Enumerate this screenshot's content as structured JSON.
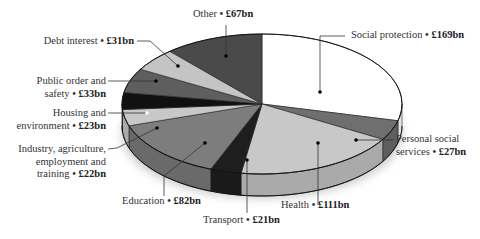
{
  "chart_data": {
    "type": "pie",
    "style": "3d-exploded-none",
    "title": "",
    "unit": "£bn",
    "slices": [
      {
        "name": "Social protection",
        "value": 169,
        "label": "Social protection",
        "value_label": "£169bn",
        "color": "#ffffff"
      },
      {
        "name": "Personal social services",
        "value": 27,
        "label": "Personal social services",
        "value_label": "£27bn",
        "color": "#6f6f6f"
      },
      {
        "name": "Health",
        "value": 111,
        "label": "Health",
        "value_label": "£111bn",
        "color": "#c8c8c8"
      },
      {
        "name": "Transport",
        "value": 21,
        "label": "Transport",
        "value_label": "£21bn",
        "color": "#1e1e1e"
      },
      {
        "name": "Education",
        "value": 82,
        "label": "Education",
        "value_label": "£82bn",
        "color": "#7d7d7d"
      },
      {
        "name": "Industry, agriculture, employment and training",
        "value": 22,
        "label": "Industry, agriculture, employment and training",
        "value_label": "£22bn",
        "color": "#c8c8c8"
      },
      {
        "name": "Housing and environment",
        "value": 23,
        "label": "Housing and environment",
        "value_label": "£23bn",
        "color": "#111111"
      },
      {
        "name": "Public order and safety",
        "value": 33,
        "label": "Public order and safety",
        "value_label": "£33bn",
        "color": "#5e5e5e"
      },
      {
        "name": "Debt interest",
        "value": 31,
        "label": "Debt interest",
        "value_label": "£31bn",
        "color": "#c4c4c4"
      },
      {
        "name": "Other",
        "value": 67,
        "label": "Other",
        "value_label": "£67bn",
        "color": "#4a4a4a"
      }
    ],
    "total": 586,
    "legend": "none (callout labels)"
  },
  "labels": {
    "other": {
      "name": "Other",
      "value": "£67bn"
    },
    "debt": {
      "name": "Debt interest",
      "value": "£31bn"
    },
    "public_order": {
      "line1": "Public order and",
      "line2": "safety",
      "value": "£33bn"
    },
    "housing": {
      "line1": "Housing and",
      "line2": "environment",
      "value": "£23bn"
    },
    "industry": {
      "line1": "Industry, agriculture,",
      "line2": "employment and",
      "line3": "training",
      "value": "£22bn"
    },
    "education": {
      "name": "Education",
      "value": "£82bn"
    },
    "transport": {
      "name": "Transport",
      "value": "£21bn"
    },
    "health": {
      "name": "Health",
      "value": "£111bn"
    },
    "pss": {
      "line1": "Personal social",
      "line2": "services",
      "value": "£27bn"
    },
    "social": {
      "name": "Social protection",
      "value": "£169bn"
    }
  },
  "separator": "•"
}
